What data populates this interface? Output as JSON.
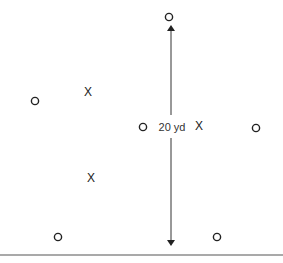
{
  "diagram": {
    "distance_label": "20 yd",
    "colors": {
      "ink": "#222222",
      "line": "#333333",
      "baseline": "#555555"
    },
    "offense_players": [
      {
        "id": "o1",
        "symbol": "O",
        "x": 169,
        "y": 17
      },
      {
        "id": "o2",
        "symbol": "O",
        "x": 35,
        "y": 101
      },
      {
        "id": "o3",
        "symbol": "O",
        "x": 143,
        "y": 127
      },
      {
        "id": "o4",
        "symbol": "O",
        "x": 256,
        "y": 128
      },
      {
        "id": "o5",
        "symbol": "O",
        "x": 58,
        "y": 237
      },
      {
        "id": "o6",
        "symbol": "O",
        "x": 217,
        "y": 237
      }
    ],
    "defense_players": [
      {
        "id": "x1",
        "symbol": "X",
        "x": 88,
        "y": 92
      },
      {
        "id": "x2",
        "symbol": "X",
        "x": 199,
        "y": 126
      },
      {
        "id": "x3",
        "symbol": "X",
        "x": 91,
        "y": 178
      }
    ],
    "arrow": {
      "x": 171,
      "y_top": 28,
      "y_bottom": 243,
      "gap_top": 115,
      "gap_bottom": 138
    },
    "baseline": {
      "y": 255
    }
  }
}
